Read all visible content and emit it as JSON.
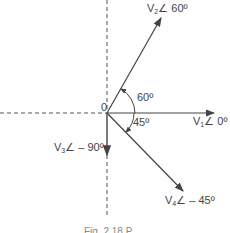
{
  "diagram": {
    "origin_label": "0",
    "phasors": [
      {
        "name": "V1",
        "sub": "1",
        "angle_label": "∠ 0º",
        "angle_deg": 0
      },
      {
        "name": "V2",
        "sub": "2",
        "angle_label": "∠ 60º",
        "angle_deg": 60
      },
      {
        "name": "V3",
        "sub": "3",
        "angle_label": "∠ – 90º",
        "angle_deg": -90
      },
      {
        "name": "V4",
        "sub": "4",
        "angle_label": "∠ – 45º",
        "angle_deg": -45
      }
    ],
    "arcs": [
      {
        "label": "60º"
      },
      {
        "label": "45º"
      }
    ],
    "caption": "Fig. 2.18 P"
  }
}
